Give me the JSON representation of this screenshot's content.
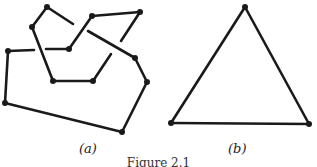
{
  "figure": {
    "caption": "Figure 2.1",
    "panels": [
      {
        "label": "(a)",
        "description": "self-crossing closed curve drawn as a polygon with broken strands at crossings",
        "vertices": [
          {
            "id": "v1",
            "x": 47,
            "y": 7
          },
          {
            "id": "v2",
            "x": 32,
            "y": 27
          },
          {
            "id": "v3",
            "x": 8,
            "y": 51
          },
          {
            "id": "v4",
            "x": 69,
            "y": 49
          },
          {
            "id": "v5",
            "x": 92,
            "y": 16
          },
          {
            "id": "v6",
            "x": 140,
            "y": 12
          },
          {
            "id": "v7",
            "x": 135,
            "y": 58
          },
          {
            "id": "v8",
            "x": 147,
            "y": 82
          },
          {
            "id": "v9",
            "x": 122,
            "y": 132
          },
          {
            "id": "v10",
            "x": 5,
            "y": 103
          },
          {
            "id": "v11",
            "x": 53,
            "y": 81
          },
          {
            "id": "v12",
            "x": 93,
            "y": 81
          }
        ]
      },
      {
        "label": "(b)",
        "description": "triangle",
        "vertices": [
          {
            "id": "t1",
            "x": 245,
            "y": 7
          },
          {
            "id": "t2",
            "x": 171,
            "y": 123
          },
          {
            "id": "t3",
            "x": 309,
            "y": 124
          }
        ]
      }
    ]
  }
}
